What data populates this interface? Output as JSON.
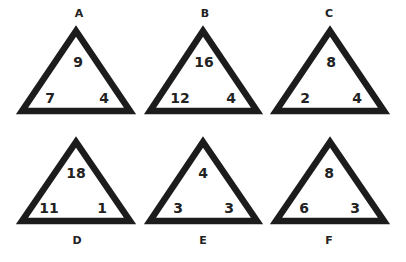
{
  "puzzle": {
    "triangles": [
      {
        "label": "A",
        "top": "9",
        "left": "7",
        "right": "4"
      },
      {
        "label": "B",
        "top": "16",
        "left": "12",
        "right": "4"
      },
      {
        "label": "C",
        "top": "8",
        "left": "2",
        "right": "4"
      },
      {
        "label": "D",
        "top": "18",
        "left": "11",
        "right": "1"
      },
      {
        "label": "E",
        "top": "4",
        "left": "3",
        "right": "3"
      },
      {
        "label": "F",
        "top": "8",
        "left": "6",
        "right": "3"
      }
    ]
  },
  "colors": {
    "stroke": "#1c1c1c",
    "text": "#222222",
    "background": "#ffffff"
  }
}
